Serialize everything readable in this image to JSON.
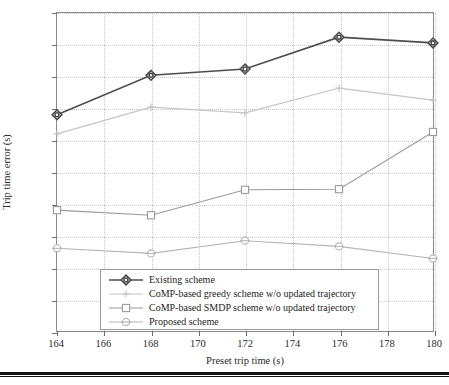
{
  "chart_data": {
    "type": "line",
    "title": "",
    "xlabel": "Preset trip time (s)",
    "ylabel": "Trip time error (s)",
    "x": [
      164,
      168,
      172,
      176,
      180
    ],
    "xlim": [
      164,
      180
    ],
    "ylim": [
      0.0,
      5.0
    ],
    "xticks": [
      "164",
      "166",
      "168",
      "170",
      "172",
      "174",
      "176",
      "178",
      "180"
    ],
    "xtick_values": [
      164,
      166,
      168,
      170,
      172,
      174,
      176,
      178,
      180
    ],
    "yticks": [
      "0.0",
      "0.5",
      "1.0",
      "1.5",
      "2.0",
      "2.5",
      "3.0",
      "3.5",
      "4.0",
      "4.5",
      "5.0"
    ],
    "ytick_values": [
      0.0,
      0.5,
      1.0,
      1.5,
      2.0,
      2.5,
      3.0,
      3.5,
      4.0,
      4.5,
      5.0
    ],
    "grid": true,
    "grid_style": "dotted",
    "legend_position": "lower center",
    "series": [
      {
        "name": "Existing scheme",
        "values": [
          3.4,
          4.02,
          4.12,
          4.62,
          4.53
        ],
        "color": "#4d4d4d",
        "marker": "diamond",
        "linewidth": 1.6
      },
      {
        "name": "CoMP-based greedy scheme w/o updated trajectory",
        "values": [
          3.1,
          3.52,
          3.43,
          3.82,
          3.63
        ],
        "color": "#c4c4c4",
        "marker": "plus",
        "linewidth": 1.2
      },
      {
        "name": "CoMP-based SMDP scheme w/o updated trajectory",
        "values": [
          1.9,
          1.82,
          2.22,
          2.23,
          3.13
        ],
        "color": "#9a9a9a",
        "marker": "square",
        "linewidth": 1.1
      },
      {
        "name": "Proposed scheme",
        "values": [
          1.3,
          1.22,
          1.42,
          1.33,
          1.14
        ],
        "color": "#b5b5b5",
        "marker": "circle",
        "linewidth": 1.1
      }
    ]
  },
  "legend": {
    "entries": [
      "Existing scheme",
      "CoMP-based greedy scheme w/o updated trajectory",
      "CoMP-based SMDP scheme w/o updated trajectory",
      "Proposed scheme"
    ]
  }
}
